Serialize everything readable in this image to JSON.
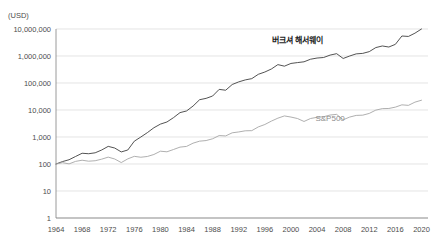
{
  "chart_data": {
    "type": "line",
    "title": "",
    "subtitle": "",
    "xlabel": "",
    "ylabel": "",
    "unit_label": "(USD)",
    "y_scale": "log",
    "ylim": [
      1,
      10000000
    ],
    "xlim": [
      1964,
      2021
    ],
    "grid": true,
    "legend_position": "inline-annotation",
    "y_tick_labels": [
      "10,000,000",
      "1,000,000",
      "100,000",
      "10,000",
      "1,000",
      "100",
      "10",
      "1"
    ],
    "y_tick_values": [
      10000000,
      1000000,
      100000,
      10000,
      1000,
      100,
      10,
      1
    ],
    "x_tick_labels": [
      "1964",
      "1968",
      "1972",
      "1976",
      "1980",
      "1984",
      "1988",
      "1992",
      "1996",
      "2000",
      "2004",
      "2008",
      "2012",
      "2016",
      "2020"
    ],
    "x_tick_values": [
      1964,
      1968,
      1972,
      1976,
      1980,
      1984,
      1988,
      1992,
      1996,
      2000,
      2004,
      2008,
      2012,
      2016,
      2020
    ],
    "colors": {
      "berkshire": "#404040",
      "sp500": "#a6a6a6",
      "grid": "#d9d9d9",
      "axis": "#808080",
      "text": "#4d4d4d"
    },
    "x": [
      1964,
      1965,
      1966,
      1967,
      1968,
      1969,
      1970,
      1971,
      1972,
      1973,
      1974,
      1975,
      1976,
      1977,
      1978,
      1979,
      1980,
      1981,
      1982,
      1983,
      1984,
      1985,
      1986,
      1987,
      1988,
      1989,
      1990,
      1991,
      1992,
      1993,
      1994,
      1995,
      1996,
      1997,
      1998,
      1999,
      2000,
      2001,
      2002,
      2003,
      2004,
      2005,
      2006,
      2007,
      2008,
      2009,
      2010,
      2011,
      2012,
      2013,
      2014,
      2015,
      2016,
      2017,
      2018,
      2019,
      2020
    ],
    "series": [
      {
        "name": "버크셔 해서웨이",
        "label": "버크셔 해서웨이",
        "color": "#404040",
        "annotation_x": 2001,
        "annotation_y": 3000000,
        "values": [
          100,
          123,
          144,
          190,
          250,
          240,
          260,
          330,
          450,
          390,
          280,
          330,
          700,
          1000,
          1450,
          2200,
          3000,
          3600,
          5200,
          8000,
          9200,
          14000,
          24000,
          27000,
          33000,
          58000,
          54000,
          88000,
          110000,
          130000,
          145000,
          210000,
          255000,
          330000,
          480000,
          420000,
          530000,
          570000,
          610000,
          760000,
          840000,
          880000,
          1080000,
          1220000,
          810000,
          1000000,
          1200000,
          1250000,
          1450000,
          2050000,
          2350000,
          2150000,
          2700000,
          5500000,
          5300000,
          7000000,
          10000000
        ]
      },
      {
        "name": "S&P500",
        "label": "S&P500",
        "color": "#a6a6a6",
        "annotation_x": 2006,
        "annotation_y": 4000,
        "values": [
          100,
          112,
          101,
          125,
          138,
          127,
          132,
          151,
          180,
          153,
          113,
          155,
          192,
          178,
          190,
          225,
          298,
          283,
          344,
          422,
          448,
          591,
          701,
          738,
          860,
          1132,
          1097,
          1431,
          1540,
          1695,
          1718,
          2363,
          2905,
          3875,
          4983,
          6030,
          5480,
          4830,
          3763,
          4842,
          5368,
          5630,
          6518,
          6876,
          4332,
          5480,
          6305,
          6438,
          7468,
          9886,
          11240,
          11396,
          12760,
          15540,
          14854,
          19530,
          23000
        ]
      }
    ]
  }
}
